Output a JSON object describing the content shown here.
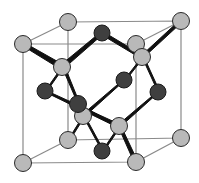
{
  "diagram": {
    "type": "crystal-unit-cell",
    "colors": {
      "light_atom": "#b9b9b9",
      "dark_atom": "#3f3f3f",
      "atom_stroke": "#2a2a2a",
      "cube_edge": "#8a8a8a",
      "bond": "#111111",
      "background": "#ffffff"
    },
    "cube": {
      "back": [
        [
          68,
          22
        ],
        [
          181,
          21
        ],
        [
          181,
          138
        ],
        [
          68,
          140
        ]
      ],
      "front": [
        [
          23,
          44
        ],
        [
          136,
          44
        ],
        [
          136,
          162
        ],
        [
          23,
          163
        ]
      ]
    },
    "light_atoms": [
      {
        "x": 68,
        "y": 22
      },
      {
        "x": 181,
        "y": 21
      },
      {
        "x": 23,
        "y": 44
      },
      {
        "x": 136,
        "y": 44
      },
      {
        "x": 142,
        "y": 57
      },
      {
        "x": 62,
        "y": 67
      },
      {
        "x": 83,
        "y": 116
      },
      {
        "x": 119,
        "y": 126
      },
      {
        "x": 68,
        "y": 140
      },
      {
        "x": 181,
        "y": 138
      },
      {
        "x": 23,
        "y": 163
      },
      {
        "x": 136,
        "y": 162
      }
    ],
    "dark_atoms": [
      {
        "x": 102,
        "y": 33
      },
      {
        "x": 45,
        "y": 91
      },
      {
        "x": 124,
        "y": 80
      },
      {
        "x": 158,
        "y": 92
      },
      {
        "x": 78,
        "y": 104
      },
      {
        "x": 102,
        "y": 151
      }
    ]
  }
}
